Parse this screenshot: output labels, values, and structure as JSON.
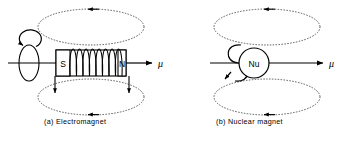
{
  "figure": {
    "type": "physics-diagram",
    "background_color": "#ffffff",
    "line_color": "#000000",
    "field_line_style": "dotted"
  },
  "panels": [
    {
      "id": "a",
      "caption": "(a) Electromagnet",
      "elements": {
        "bar_magnet": {
          "south_pole_label": "S",
          "north_pole_label": "N"
        },
        "coil": {
          "name": "solenoid-coil",
          "turns": 8
        },
        "moment_label": "μ",
        "spin_axis": {
          "name": "rotation-ellipse",
          "direction": "counterclockwise"
        },
        "field_lines": {
          "count": 2,
          "arrow_direction": "leftward"
        },
        "flux_arrows": {
          "count": 2,
          "direction": "downward"
        }
      }
    },
    {
      "id": "b",
      "caption": "(b) Nuclear magnet",
      "elements": {
        "nucleus": {
          "label": "Nu",
          "shape": "circle"
        },
        "moment_label": "μ",
        "spin_loop": {
          "name": "nuclear-spin-loop",
          "direction": "counterclockwise"
        },
        "field_lines": {
          "count": 2,
          "arrow_direction": "leftward"
        }
      }
    }
  ]
}
